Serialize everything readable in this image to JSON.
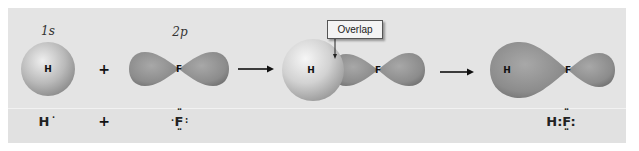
{
  "figure": {
    "colors": {
      "panel_bg": "#e4e4e4",
      "orbital_fill": "#8f8f8f",
      "sphere_light": "#eeeeee",
      "sphere_dark": "#8a8a8a",
      "text": "#111111"
    },
    "step1": {
      "s_orbital_label": "1s",
      "s_nucleus": "H",
      "plus": "+",
      "p_orbital_label": "2p",
      "p_nucleus": "F"
    },
    "step2": {
      "arrow": "→",
      "h_nucleus": "H",
      "f_nucleus": "F",
      "callout": "Overlap"
    },
    "step3": {
      "arrow": "→",
      "h_nucleus": "H",
      "f_nucleus": "F"
    },
    "lewis": {
      "h_atom": "H",
      "h_dot": "·",
      "plus": "+",
      "f_atom": "F",
      "f_left_dot": "·",
      "f_right_pair": ":",
      "f_top_pair": "··",
      "f_bottom_pair": "··",
      "product": "H:F:"
    }
  }
}
